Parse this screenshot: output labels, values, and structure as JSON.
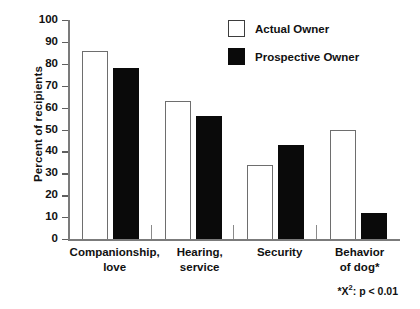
{
  "chart_data": {
    "type": "bar",
    "title": "",
    "xlabel": "",
    "ylabel": "Percent of recipients",
    "ylim": [
      0,
      100
    ],
    "ytick_step": 10,
    "yticks": [
      100,
      90,
      80,
      70,
      60,
      50,
      40,
      30,
      20,
      10,
      0
    ],
    "grid": false,
    "legend_position": "top-right",
    "categories": [
      {
        "line1": "Companionship,",
        "line2": "love"
      },
      {
        "line1": "Hearing,",
        "line2": "service"
      },
      {
        "line1": "Security",
        "line2": ""
      },
      {
        "line1": "Behavior",
        "line2": "of dog*"
      }
    ],
    "series": [
      {
        "name": "Actual Owner",
        "color": "#ffffff",
        "edge_color": "#6e6e6e",
        "values": [
          86,
          63,
          34,
          50
        ]
      },
      {
        "name": "Prospective Owner",
        "color": "#0a0a0a",
        "edge_color": "#0a0a0a",
        "values": [
          78,
          56,
          43,
          12
        ]
      }
    ],
    "annotations": [
      {
        "name": "significance-footnote",
        "text": "*X2:  p < 0.01"
      }
    ]
  },
  "legend": {
    "items": [
      {
        "label": "Actual Owner"
      },
      {
        "label": "Prospective Owner"
      }
    ]
  },
  "footnote": {
    "prefix": "*X",
    "superscript": "2",
    "suffix": ":  p < 0.01"
  }
}
